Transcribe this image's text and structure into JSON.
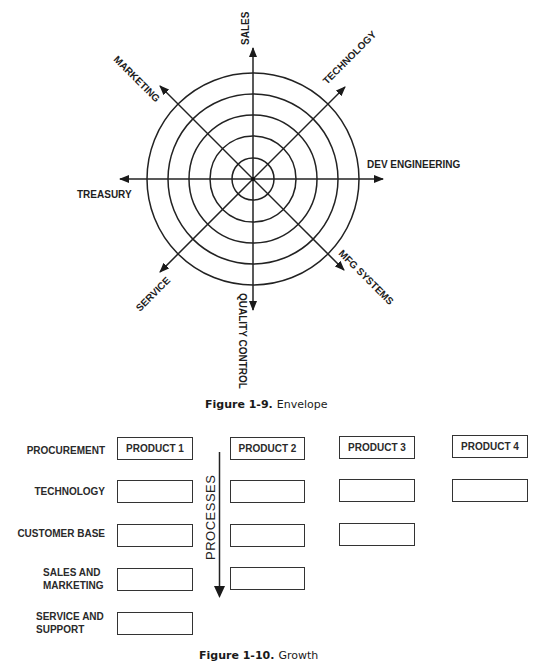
{
  "figure_1_9": {
    "caption_number": "Figure 1-9.",
    "caption_title": "Envelope",
    "center": [
      253,
      179
    ],
    "ring_radii": [
      21,
      43,
      64,
      85,
      106
    ],
    "axes": [
      {
        "id": "sales",
        "label": "SALES",
        "angle_deg": 90
      },
      {
        "id": "technology",
        "label": "TECHNOLOGY",
        "angle_deg": 45
      },
      {
        "id": "dev-engineering",
        "label": "DEV ENGINEERING",
        "angle_deg": 0
      },
      {
        "id": "mfg-systems",
        "label": "MFG SYSTEMS",
        "angle_deg": -45
      },
      {
        "id": "quality-control",
        "label": "QUALITY CONTROL",
        "angle_deg": -90
      },
      {
        "id": "service",
        "label": "SERVICE",
        "angle_deg": -135
      },
      {
        "id": "treasury",
        "label": "TREASURY",
        "angle_deg": 180
      },
      {
        "id": "marketing",
        "label": "MARKETING",
        "angle_deg": 135
      }
    ]
  },
  "figure_1_10": {
    "caption_number": "Figure 1-10.",
    "caption_title": "Growth",
    "arrow_label": "PROCESSES",
    "rows": [
      {
        "label": "PROCUREMENT"
      },
      {
        "label": "TECHNOLOGY"
      },
      {
        "label": "CUSTOMER BASE"
      },
      {
        "label": "SALES AND MARKETING",
        "line1": "SALES AND",
        "line2": "MARKETING"
      },
      {
        "label": "SERVICE AND SUPPORT",
        "line1": "SERVICE AND",
        "line2": "SUPPORT"
      }
    ],
    "products": [
      {
        "label": "PRODUCT 1",
        "filled_rows": 5
      },
      {
        "label": "PRODUCT 2",
        "filled_rows": 4
      },
      {
        "label": "PRODUCT 3",
        "filled_rows": 3
      },
      {
        "label": "PRODUCT 4",
        "filled_rows": 2
      }
    ]
  }
}
